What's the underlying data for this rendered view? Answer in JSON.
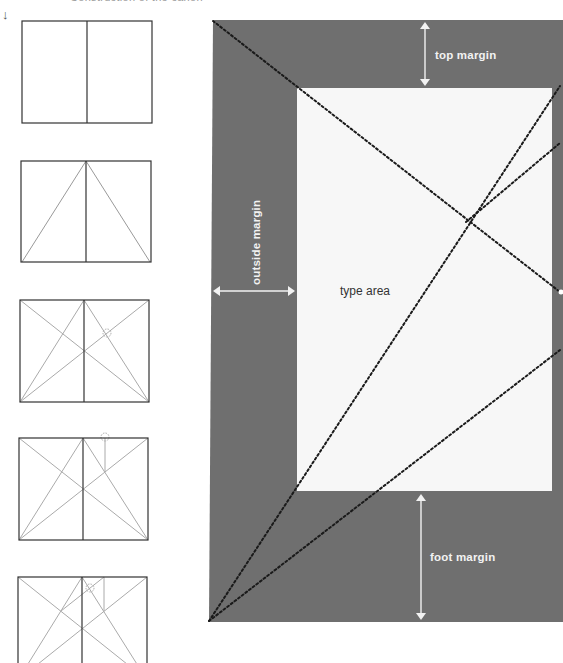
{
  "caption": "Construction of the canon",
  "steps_indicator": "↓",
  "thumbnails": [
    {
      "step": 1,
      "description": "double-page spread with spine"
    },
    {
      "step": 2,
      "description": "diagonals from spine top to outer bottom corners"
    },
    {
      "step": 3,
      "description": "page and spread diagonals with intersection marked"
    },
    {
      "step": 4,
      "description": "vertical from intersection to top edge"
    },
    {
      "step": 5,
      "description": "line from top point to spread diagonal defining type area corner"
    }
  ],
  "diagram": {
    "labels": {
      "top_margin": "top margin",
      "outside_margin": "outside margin",
      "type_area": "type area",
      "foot_margin": "foot margin"
    },
    "colors": {
      "page": "#6f6f6f",
      "type_area": "#f7f7f7",
      "arrow": "#f2f2f2",
      "guide_line": "#1a1a1a",
      "thumb_stroke": "#333333",
      "thumb_guide": "#a8a8a8"
    }
  }
}
